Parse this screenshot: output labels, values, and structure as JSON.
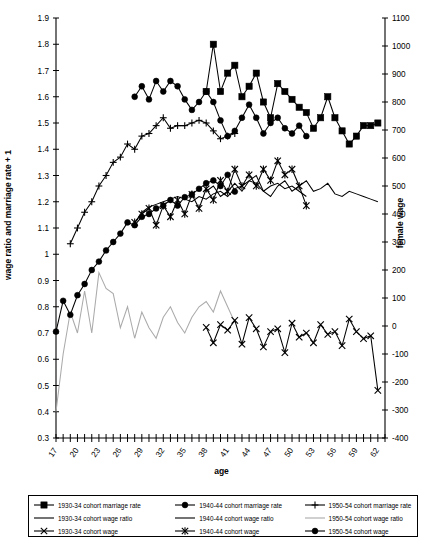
{
  "chart_data": {
    "type": "line",
    "title": "",
    "xlabel": "age",
    "ylabel": "wage ratio and marriage rate + 1",
    "y2label": "female wage",
    "xlim": [
      17,
      63
    ],
    "ylim": [
      0.3,
      1.9
    ],
    "y2lim": [
      -400,
      1100
    ],
    "grid": false,
    "legend_position": "bottom",
    "x_ticks": [
      17,
      20,
      23,
      26,
      29,
      32,
      35,
      38,
      41,
      44,
      47,
      50,
      53,
      56,
      59,
      62
    ],
    "x_minor_step": 1,
    "y_ticks": [
      0.3,
      0.4,
      0.5,
      0.6,
      0.7,
      0.8,
      0.9,
      1.0,
      1.1,
      1.2,
      1.3,
      1.4,
      1.5,
      1.6,
      1.7,
      1.8,
      1.9
    ],
    "y_tick_labels": [
      "0.3",
      "0.4",
      "0.5",
      "0.6",
      "0.7",
      "0.8",
      "0.9",
      "1",
      "1.1",
      "1.2",
      "1.3",
      "1.4",
      "1.5",
      "1.6",
      "1.7",
      "1.8",
      "1.9"
    ],
    "y2_ticks": [
      -400,
      -300,
      -200,
      -100,
      0,
      100,
      200,
      300,
      400,
      500,
      600,
      700,
      800,
      900,
      1000,
      1100
    ],
    "y2_tick_labels": [
      "-400",
      "-300",
      "-200",
      "-100",
      "0",
      "100",
      "200",
      "300",
      "400",
      "500",
      "600",
      "700",
      "800",
      "900",
      "1000",
      "1100"
    ],
    "series": [
      {
        "name": "1930-34 cohort marriage rate",
        "key": "mr3034",
        "axis": "left",
        "marker": "square",
        "color": "#000000",
        "x": [
          38,
          39,
          40,
          41,
          42,
          43,
          44,
          45,
          46,
          47,
          48,
          49,
          50,
          51,
          52,
          53,
          54,
          55,
          56,
          57,
          58,
          59,
          60,
          61,
          62
        ],
        "y": [
          1.62,
          1.8,
          1.62,
          1.69,
          1.72,
          1.6,
          1.64,
          1.69,
          1.58,
          1.52,
          1.65,
          1.62,
          1.59,
          1.56,
          1.54,
          1.48,
          1.52,
          1.6,
          1.52,
          1.47,
          1.42,
          1.45,
          1.49,
          1.49,
          1.5
        ]
      },
      {
        "name": "1940-44 cohort marriage rate",
        "key": "mr4044",
        "axis": "left",
        "marker": "circle",
        "color": "#000000",
        "x": [
          28,
          29,
          30,
          31,
          32,
          33,
          34,
          35,
          36,
          37,
          38,
          39,
          40,
          41,
          42,
          43,
          44,
          45,
          46,
          47,
          48,
          49,
          50,
          51,
          52
        ],
        "y": [
          1.6,
          1.64,
          1.59,
          1.66,
          1.62,
          1.66,
          1.64,
          1.59,
          1.55,
          1.58,
          1.62,
          1.58,
          1.51,
          1.45,
          1.47,
          1.52,
          1.57,
          1.52,
          1.46,
          1.5,
          1.52,
          1.48,
          1.46,
          1.49,
          1.45
        ]
      },
      {
        "name": "1950-54 cohort marriage rate",
        "key": "mr5054",
        "axis": "left",
        "marker": "plus",
        "color": "#000000",
        "x": [
          19,
          20,
          21,
          22,
          23,
          24,
          25,
          26,
          27,
          28,
          29,
          30,
          31,
          32,
          33,
          34,
          35,
          36,
          37,
          38,
          39,
          40,
          41,
          42
        ],
        "y": [
          1.04,
          1.1,
          1.16,
          1.2,
          1.26,
          1.3,
          1.35,
          1.37,
          1.42,
          1.4,
          1.45,
          1.46,
          1.49,
          1.52,
          1.48,
          1.49,
          1.49,
          1.5,
          1.51,
          1.5,
          1.47,
          1.44,
          1.45,
          1.46
        ]
      },
      {
        "name": "1930-34 cohort wage ratio",
        "key": "wr3034",
        "axis": "left",
        "marker": "none",
        "color": "#000000",
        "x": [
          38,
          39,
          40,
          41,
          42,
          43,
          44,
          45,
          46,
          47,
          48,
          49,
          50,
          51,
          52,
          53,
          54,
          55,
          56,
          57,
          58,
          59,
          60,
          61,
          62
        ],
        "y": [
          1.24,
          1.26,
          1.22,
          1.24,
          1.27,
          1.24,
          1.28,
          1.3,
          1.24,
          1.22,
          1.26,
          1.28,
          1.24,
          1.26,
          1.28,
          1.24,
          1.25,
          1.27,
          1.23,
          1.22,
          1.24,
          1.23,
          1.22,
          1.21,
          1.2
        ]
      },
      {
        "name": "1940-44 cohort wage ratio",
        "key": "wr4044",
        "axis": "left",
        "marker": "none",
        "color": "#000000",
        "x": [
          28,
          29,
          30,
          31,
          32,
          33,
          34,
          35,
          36,
          37,
          38,
          39,
          40,
          41,
          42,
          43,
          44,
          45,
          46,
          47,
          48,
          49,
          50,
          51,
          52
        ],
        "y": [
          1.12,
          1.16,
          1.18,
          1.19,
          1.2,
          1.21,
          1.22,
          1.21,
          1.2,
          1.22,
          1.21,
          1.23,
          1.24,
          1.22,
          1.25,
          1.26,
          1.28,
          1.27,
          1.24,
          1.26,
          1.27,
          1.25,
          1.26,
          1.24,
          1.22
        ]
      },
      {
        "name": "1950-54 cohort wage ratio",
        "key": "wr5054",
        "axis": "left",
        "marker": "none",
        "color": "#aaaaaa",
        "x": [
          17,
          18,
          19,
          20,
          21,
          22,
          23,
          24,
          25,
          26,
          27,
          28,
          29,
          30,
          31,
          32,
          33,
          34,
          35,
          36,
          37,
          38,
          39,
          40,
          41,
          42
        ],
        "y": [
          0.4,
          0.62,
          0.78,
          0.7,
          0.86,
          0.7,
          0.93,
          0.87,
          0.85,
          0.72,
          0.8,
          0.68,
          0.78,
          0.72,
          0.68,
          0.76,
          0.8,
          0.74,
          0.7,
          0.76,
          0.8,
          0.82,
          0.78,
          0.86,
          0.8,
          0.74
        ]
      },
      {
        "name": "1930-34 cohort wage",
        "key": "w3034",
        "axis": "right",
        "marker": "x",
        "color": "#000000",
        "x": [
          38,
          39,
          40,
          41,
          42,
          43,
          44,
          45,
          46,
          47,
          48,
          49,
          50,
          51,
          52,
          53,
          54,
          55,
          56,
          57,
          58,
          59,
          60,
          61,
          62
        ],
        "y": [
          -5,
          -60,
          5,
          -15,
          20,
          -65,
          30,
          -10,
          -75,
          -20,
          -10,
          -95,
          10,
          -40,
          -25,
          -60,
          5,
          -30,
          -20,
          -70,
          25,
          -20,
          -45,
          -35,
          -230
        ]
      },
      {
        "name": "1940-44 cohort wage",
        "key": "w4044",
        "axis": "right",
        "marker": "asterisk",
        "color": "#000000",
        "x": [
          28,
          29,
          30,
          31,
          32,
          33,
          34,
          35,
          36,
          37,
          38,
          39,
          40,
          41,
          42,
          43,
          44,
          45,
          46,
          47,
          48,
          49,
          50,
          51,
          52
        ],
        "y": [
          370,
          400,
          420,
          360,
          430,
          390,
          450,
          400,
          470,
          420,
          490,
          450,
          520,
          480,
          560,
          500,
          540,
          500,
          560,
          520,
          590,
          540,
          560,
          500,
          430
        ]
      },
      {
        "name": "1950-54 cohort wage",
        "key": "w5054",
        "axis": "right",
        "marker": "filled-circle",
        "color": "#000000",
        "x": [
          17,
          18,
          19,
          20,
          21,
          22,
          23,
          24,
          25,
          26,
          27,
          28,
          29,
          30,
          31,
          32,
          33,
          34,
          35,
          36,
          37,
          38,
          39,
          40,
          41,
          42
        ],
        "y": [
          -20,
          90,
          40,
          110,
          150,
          200,
          230,
          270,
          300,
          330,
          370,
          360,
          390,
          400,
          420,
          430,
          450,
          430,
          460,
          470,
          490,
          510,
          520,
          500,
          540,
          480
        ]
      }
    ]
  },
  "legend": {
    "rows": [
      [
        {
          "marker": "square",
          "color": "#000000",
          "label": "1930-34 cohort marriage rate"
        },
        {
          "marker": "circle",
          "color": "#000000",
          "label": "1940-44 cohort marriage rate"
        },
        {
          "marker": "plus",
          "color": "#000000",
          "label": "1950-54 cohort marriage rate"
        }
      ],
      [
        {
          "marker": "none",
          "color": "#000000",
          "label": "1930-34 cohort wage ratio"
        },
        {
          "marker": "none",
          "color": "#000000",
          "label": "1940-44 cohort wage ratio"
        },
        {
          "marker": "none",
          "color": "#aaaaaa",
          "label": "1950-54 cohort wage ratio"
        }
      ],
      [
        {
          "marker": "x",
          "color": "#000000",
          "label": "1930-34 cohort wage"
        },
        {
          "marker": "asterisk",
          "color": "#000000",
          "label": "1940-44 cohort wage"
        },
        {
          "marker": "filled-circle",
          "color": "#000000",
          "label": "1950-54 cohort wage"
        }
      ]
    ]
  }
}
